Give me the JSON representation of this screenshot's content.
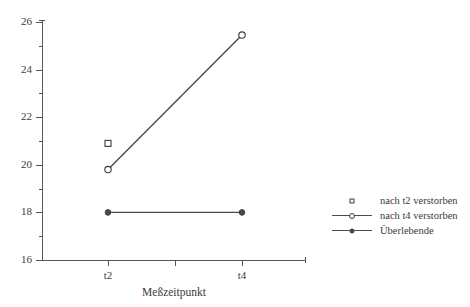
{
  "chart_data": {
    "type": "line",
    "title": "",
    "xlabel": "Meßzeitpunkt",
    "ylabel": "",
    "categories": [
      "t2",
      "t4"
    ],
    "x_ticks": [
      "t2",
      "",
      "t4"
    ],
    "y_ticks": [
      "16",
      "18",
      "20",
      "22",
      "24",
      "26"
    ],
    "y_minor_ticks": [
      17,
      19,
      21,
      23,
      25
    ],
    "ylim": [
      16,
      26
    ],
    "grid": false,
    "legend_position": "right-outside",
    "series": [
      {
        "name": "nach t2 verstorben",
        "marker": "open-square",
        "line": false,
        "x": [
          "t2"
        ],
        "values": [
          20.9
        ]
      },
      {
        "name": "nach t4 verstorben",
        "marker": "open-circle",
        "line": true,
        "x": [
          "t2",
          "t4"
        ],
        "values": [
          19.8,
          25.45
        ]
      },
      {
        "name": "Überlebende",
        "marker": "filled-circle",
        "line": true,
        "x": [
          "t2",
          "t4"
        ],
        "values": [
          18.0,
          18.0
        ]
      }
    ]
  },
  "axes": {
    "y_labels": [
      "26",
      "24",
      "22",
      "20",
      "18",
      "16"
    ],
    "x_labels": [
      "t2",
      "t4"
    ],
    "x_title": "Meßzeitpunkt"
  },
  "legend": {
    "entries": [
      {
        "label": "nach t2 verstorben"
      },
      {
        "label": "nach t4 verstorben"
      },
      {
        "label": "Überlebende"
      }
    ]
  },
  "colors": {
    "ink": "#3b3b3b",
    "line": "#4a4a4a",
    "axis": "#555555",
    "background": "#ffffff"
  }
}
